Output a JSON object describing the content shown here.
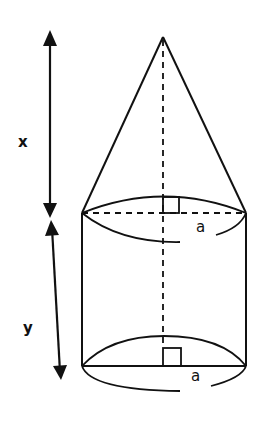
{
  "figure": {
    "labels": {
      "cone_height": "x",
      "cylinder_height": "y",
      "top_radius": "a",
      "bottom_radius": "a"
    },
    "colors": {
      "stroke": "#111111",
      "background": "#ffffff"
    }
  }
}
